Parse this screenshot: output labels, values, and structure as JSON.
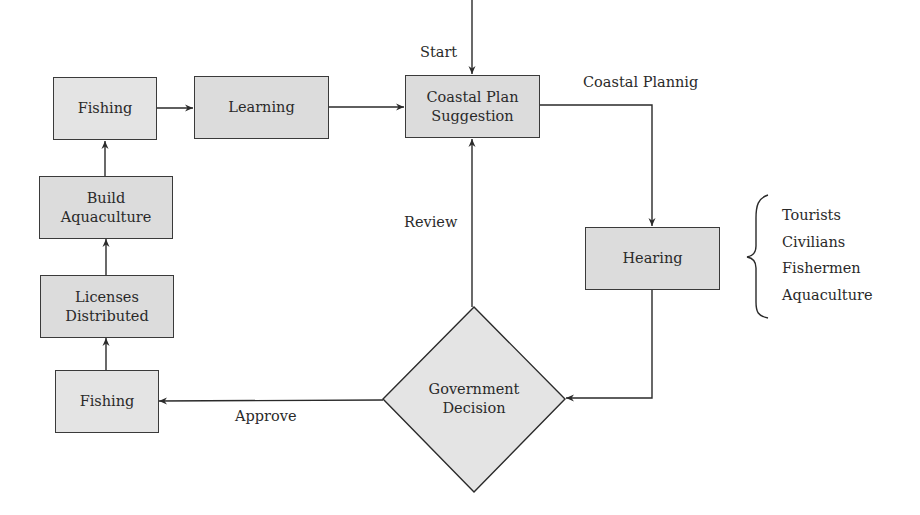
{
  "diagram": {
    "type": "flowchart",
    "nodes": {
      "fishing_top": {
        "label": "Fishing"
      },
      "learning": {
        "label": "Learning"
      },
      "coastal_plan": {
        "line1": "Coastal Plan",
        "line2": "Suggestion"
      },
      "hearing": {
        "label": "Hearing"
      },
      "government_decision": {
        "line1": "Government",
        "line2": "Decision"
      },
      "fishing_bottom": {
        "label": "Fishing"
      },
      "licenses_distributed": {
        "line1": "Licenses",
        "line2": "Distributed"
      },
      "build_aquaculture": {
        "line1": "Build",
        "line2": "Aquaculture"
      }
    },
    "edge_labels": {
      "start": "Start",
      "coastal_planning": "Coastal Plannig",
      "review": "Review",
      "approve": "Approve"
    },
    "stakeholders": [
      "Tourists",
      "Civilians",
      "Fishermen",
      "Aquaculture"
    ],
    "edges": [
      {
        "from": "start",
        "to": "coastal_plan",
        "label": "Start"
      },
      {
        "from": "coastal_plan",
        "to": "hearing",
        "label": "Coastal Plannig"
      },
      {
        "from": "hearing",
        "to": "government_decision",
        "label": ""
      },
      {
        "from": "government_decision",
        "to": "coastal_plan",
        "label": "Review"
      },
      {
        "from": "government_decision",
        "to": "fishing_bottom",
        "label": "Approve"
      },
      {
        "from": "fishing_bottom",
        "to": "licenses_distributed",
        "label": ""
      },
      {
        "from": "licenses_distributed",
        "to": "build_aquaculture",
        "label": ""
      },
      {
        "from": "build_aquaculture",
        "to": "fishing_top",
        "label": ""
      },
      {
        "from": "fishing_top",
        "to": "learning",
        "label": ""
      },
      {
        "from": "learning",
        "to": "coastal_plan",
        "label": ""
      }
    ],
    "colors": {
      "node_fill": "#dcdcdc",
      "node_fill_light": "#e4e4e4",
      "stroke": "#3a3a3a",
      "text": "#2a2a2a",
      "background": "#ffffff"
    }
  }
}
